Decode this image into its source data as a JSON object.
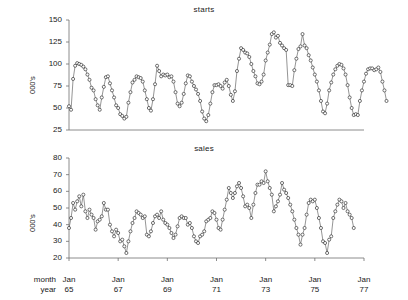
{
  "chart_data": [
    {
      "type": "line",
      "title": "starts",
      "ylabel": "000's",
      "xlabel": "",
      "ylim": [
        25,
        150
      ],
      "yticks": [
        25,
        50,
        75,
        100,
        125,
        150
      ],
      "xlim_year": [
        1965.0,
        1977.0
      ],
      "xticks_year": [
        1965,
        1967,
        1969,
        1971,
        1973,
        1975,
        1977
      ],
      "xticklabels": [
        "Jan 65",
        "Jan 67",
        "Jan 69",
        "Jan 71",
        "Jan 73",
        "Jan 75",
        "Jan 77"
      ],
      "grid": false,
      "legend": "none",
      "marker": "open-circle",
      "x_start_year": 1965.0,
      "x_step_years": 0.08333,
      "values": [
        52,
        48,
        83,
        98,
        101,
        100,
        99,
        97,
        94,
        88,
        82,
        73,
        70,
        60,
        53,
        48,
        62,
        74,
        85,
        86,
        78,
        70,
        62,
        53,
        50,
        43,
        41,
        38,
        40,
        56,
        68,
        79,
        82,
        86,
        85,
        84,
        80,
        70,
        60,
        50,
        47,
        60,
        77,
        98,
        92,
        86,
        88,
        87,
        88,
        85,
        86,
        80,
        68,
        55,
        52,
        56,
        66,
        78,
        87,
        86,
        80,
        75,
        71,
        66,
        58,
        46,
        38,
        35,
        42,
        55,
        68,
        76,
        76,
        77,
        75,
        72,
        79,
        82,
        75,
        65,
        58,
        69,
        92,
        106,
        118,
        116,
        113,
        112,
        108,
        100,
        92,
        86,
        78,
        77,
        80,
        88,
        104,
        113,
        122,
        134,
        136,
        130,
        132,
        124,
        121,
        118,
        116,
        76,
        76,
        75,
        93,
        106,
        117,
        120,
        134,
        121,
        118,
        110,
        104,
        96,
        88,
        80,
        70,
        58,
        46,
        44,
        55,
        70,
        79,
        88,
        94,
        98,
        100,
        99,
        95,
        88,
        76,
        62,
        50,
        42,
        43,
        42,
        58,
        70,
        80,
        89,
        94,
        95,
        95,
        93,
        94,
        96,
        91,
        80,
        70,
        58
      ]
    },
    {
      "type": "line",
      "title": "sales",
      "ylabel": "000's",
      "xlabel": "",
      "ylim": [
        20,
        80
      ],
      "yticks": [
        20,
        30,
        40,
        50,
        60,
        70,
        80
      ],
      "xlim_year": [
        1965.0,
        1977.0
      ],
      "xticks_year": [
        1965,
        1967,
        1969,
        1971,
        1973,
        1975,
        1977
      ],
      "xticklabels": [
        "Jan 65",
        "Jan 67",
        "Jan 69",
        "Jan 71",
        "Jan 73",
        "Jan 75",
        "Jan 77"
      ],
      "grid": false,
      "legend": "none",
      "marker": "open-circle",
      "x_start_year": 1965.0,
      "x_step_years": 0.08333,
      "values": [
        38,
        44,
        53,
        49,
        54,
        57,
        51,
        58,
        48,
        44,
        49,
        46,
        44,
        37,
        42,
        43,
        45,
        53,
        49,
        49,
        40,
        36,
        33,
        37,
        35,
        30,
        31,
        27,
        23,
        30,
        36,
        41,
        44,
        48,
        47,
        46,
        44,
        45,
        34,
        33,
        36,
        41,
        45,
        46,
        44,
        48,
        43,
        41,
        40,
        38,
        35,
        32,
        34,
        39,
        44,
        45,
        44,
        44,
        40,
        41,
        38,
        33,
        30,
        29,
        33,
        34,
        36,
        42,
        43,
        44,
        48,
        47,
        43,
        38,
        37,
        43,
        49,
        55,
        62,
        59,
        56,
        59,
        63,
        65,
        62,
        57,
        51,
        52,
        50,
        44,
        52,
        59,
        64,
        64,
        66,
        65,
        72,
        66,
        62,
        58,
        48,
        51,
        54,
        58,
        65,
        61,
        59,
        56,
        52,
        48,
        43,
        38,
        34,
        28,
        34,
        38,
        46,
        53,
        55,
        54,
        55,
        50,
        44,
        38,
        30,
        29,
        23,
        31,
        33,
        44,
        48,
        52,
        55,
        54,
        50,
        53,
        48,
        46,
        44,
        38
      ]
    }
  ],
  "axis": {
    "row_label_month": "month",
    "row_label_year": "year",
    "xticks": [
      {
        "month": "Jan",
        "year": "65"
      },
      {
        "month": "Jan",
        "year": "67"
      },
      {
        "month": "Jan",
        "year": "69"
      },
      {
        "month": "Jan",
        "year": "71"
      },
      {
        "month": "Jan",
        "year": "73"
      },
      {
        "month": "Jan",
        "year": "75"
      },
      {
        "month": "Jan",
        "year": "77"
      }
    ]
  },
  "colors": {
    "line": "#4d4d4d",
    "marker_stroke": "#1a1a1a",
    "marker_fill": "#ffffff",
    "axis": "#6e6e6e",
    "text": "#1a1a1a",
    "background": "#ffffff"
  }
}
